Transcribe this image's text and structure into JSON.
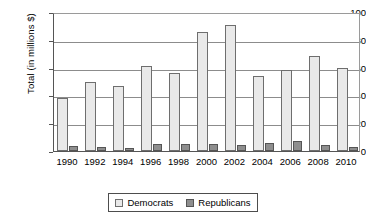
{
  "chart_data": {
    "type": "bar",
    "title": "",
    "subtitle": "",
    "xlabel": "",
    "ylabel": "Total (in millions $)",
    "categories": [
      "1990",
      "1992",
      "1994",
      "1996",
      "1998",
      "2000",
      "2002",
      "2004",
      "2006",
      "2008",
      "2010"
    ],
    "series": [
      {
        "name": "Democrats",
        "color": "#e9e9e9",
        "values": [
          38,
          50,
          47,
          61,
          56,
          85.5,
          91,
          54,
          58.5,
          68,
          60
        ]
      },
      {
        "name": "Republicans",
        "color": "#8e8e8e",
        "values": [
          3.5,
          3,
          2.5,
          5,
          5,
          5,
          4.5,
          6,
          7,
          4.5,
          3
        ]
      }
    ],
    "ylim": [
      0,
      100
    ],
    "yticks": [
      0,
      20,
      40,
      60,
      80,
      100
    ],
    "ytick_labels": [
      "0",
      "20",
      "40",
      "60",
      "80",
      "100"
    ],
    "grid": true,
    "grid_axis": "y",
    "legend_position": "bottom",
    "legend_entries": [
      "Democrats",
      "Republicans"
    ]
  },
  "axis": {
    "y_title": "Total (in millions $)"
  },
  "legend": {
    "democrats_label": "Democrats",
    "republicans_label": "Republicans"
  }
}
